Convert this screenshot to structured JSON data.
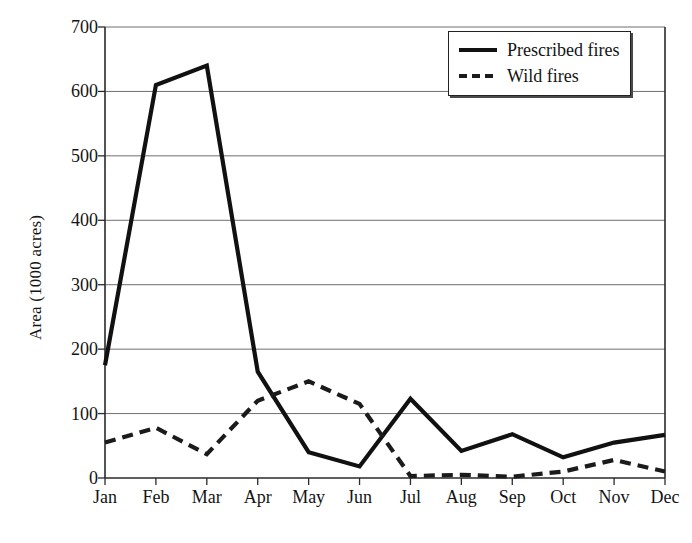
{
  "chart_data": {
    "type": "line",
    "title": "",
    "xlabel": "",
    "ylabel": "Area (1000 acres)",
    "categories": [
      "Jan",
      "Feb",
      "Mar",
      "Apr",
      "May",
      "Jun",
      "Jul",
      "Aug",
      "Sep",
      "Oct",
      "Nov",
      "Dec"
    ],
    "series": [
      {
        "name": "Prescribed fires",
        "style": "solid",
        "color": "#111111",
        "values": [
          175,
          610,
          640,
          165,
          40,
          18,
          123,
          42,
          68,
          32,
          55,
          67
        ]
      },
      {
        "name": "Wild fires",
        "style": "dashed",
        "color": "#1b1b1b",
        "values": [
          55,
          78,
          37,
          120,
          150,
          115,
          3,
          5,
          2,
          10,
          28,
          10
        ]
      }
    ],
    "ylim": [
      0,
      700
    ],
    "yticks": [
      0,
      100,
      200,
      300,
      400,
      500,
      600,
      700
    ],
    "ytick_labels": [
      "0",
      "100",
      "200",
      "300",
      "400",
      "500",
      "600",
      "700"
    ],
    "grid": "horizontal",
    "legend_position": "top-right",
    "legend_entries": [
      "Prescribed fires",
      "Wild fires"
    ]
  },
  "legend": {
    "entry_0_label": "Prescribed fires",
    "entry_1_label": "Wild fires"
  },
  "axes": {
    "y_title": "Area (1000 acres)"
  }
}
